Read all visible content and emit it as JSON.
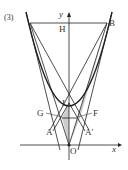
{
  "problem_number": "(3)",
  "axes": {
    "x_label": "x",
    "y_label": "y"
  },
  "points": {
    "H": "H",
    "B": "B",
    "I": "I",
    "G": "G",
    "F": "F",
    "A": "A",
    "A_prime": "A′",
    "O": "O"
  },
  "colors": {
    "line": "#222222",
    "shade": "#cccccc"
  }
}
